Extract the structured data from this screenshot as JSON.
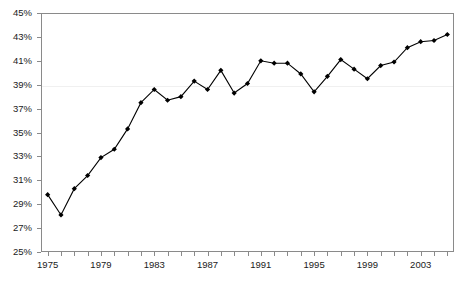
{
  "chart_data": {
    "type": "line",
    "title": "",
    "subtitle": "",
    "xlabel": "",
    "ylabel": "",
    "xlim": [
      1974.5,
      2005.5
    ],
    "ylim": [
      25,
      45
    ],
    "ytick_values": [
      25,
      27,
      29,
      31,
      33,
      35,
      37,
      39,
      41,
      43,
      45
    ],
    "ytick_labels": [
      "25%",
      "27%",
      "29%",
      "31%",
      "33%",
      "35%",
      "37%",
      "39%",
      "41%",
      "43%",
      "45%"
    ],
    "xtick_values": [
      1975,
      1976,
      1977,
      1978,
      1979,
      1980,
      1981,
      1982,
      1983,
      1984,
      1985,
      1986,
      1987,
      1988,
      1989,
      1990,
      1991,
      1992,
      1993,
      1994,
      1995,
      1996,
      1997,
      1998,
      1999,
      2000,
      2001,
      2002,
      2003,
      2004,
      2005
    ],
    "xtick_labels": [
      "1975",
      "",
      "",
      "",
      "1979",
      "",
      "",
      "",
      "1983",
      "",
      "",
      "",
      "1987",
      "",
      "",
      "",
      "1991",
      "",
      "",
      "",
      "1995",
      "",
      "",
      "",
      "1999",
      "",
      "",
      "",
      "2003",
      "",
      ""
    ],
    "grid": "horizontal-faint-39",
    "gridline_values": [
      39
    ],
    "legend": "none",
    "marker": "diamond",
    "line_color": "#000000",
    "marker_color": "#000000",
    "axis_color": "#8a8a8a",
    "background": "#ffffff",
    "x": [
      1975,
      1976,
      1977,
      1978,
      1979,
      1980,
      1981,
      1982,
      1983,
      1984,
      1985,
      1986,
      1987,
      1988,
      1989,
      1990,
      1991,
      1992,
      1993,
      1994,
      1995,
      1996,
      1997,
      1998,
      1999,
      2000,
      2001,
      2002,
      2003,
      2004,
      2005
    ],
    "values": [
      29.8,
      28.1,
      30.3,
      31.4,
      32.9,
      33.6,
      35.3,
      37.5,
      38.6,
      37.7,
      38.0,
      39.3,
      38.6,
      40.2,
      38.3,
      39.1,
      41.0,
      40.8,
      40.8,
      39.9,
      38.4,
      39.7,
      41.1,
      40.3,
      39.5,
      40.6,
      40.9,
      42.1,
      42.6,
      42.7,
      43.2
    ]
  }
}
